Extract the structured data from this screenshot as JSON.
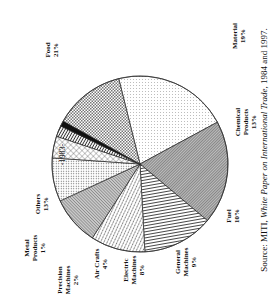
{
  "chart_data": {
    "type": "pie",
    "title": "-1983-",
    "orientation_note": "figure rotated 90 degrees counter-clockwise",
    "slices": [
      {
        "label": "Food",
        "value": 21
      },
      {
        "label": "Material",
        "value": 19
      },
      {
        "label": "Chemical Products",
        "value": 13
      },
      {
        "label": "Fuel",
        "value": 10
      },
      {
        "label": "General Machines",
        "value": 9
      },
      {
        "label": "Electric Machines",
        "value": 8
      },
      {
        "label": "Air Crafts",
        "value": 4
      },
      {
        "label": "Precision Machines",
        "value": 2
      },
      {
        "label": "Metal Products",
        "value": 1
      },
      {
        "label": "Others",
        "value": 13
      }
    ],
    "source": "Source: MITI, White Paper on International Trade, 1984 and 1997."
  },
  "labels": {
    "title": "-1983-",
    "food": [
      "Food",
      "21%"
    ],
    "material": [
      "Material",
      "19%"
    ],
    "chemical": [
      "Chemical",
      "Products",
      "13%"
    ],
    "fuel": [
      "Fuel",
      "10%"
    ],
    "general": [
      "General",
      "Machines",
      "9%"
    ],
    "electric": [
      "Electric",
      "Machines",
      "8%"
    ],
    "air": [
      "Air Crafts",
      "4%"
    ],
    "precision": [
      "Precision",
      "Machines",
      "2%"
    ],
    "metal": [
      "Metal",
      "Products",
      "1%"
    ],
    "others": [
      "Others",
      "13%"
    ]
  },
  "source": {
    "prefix": "Source: MITI, ",
    "italic": "White Paper on International Trade",
    "suffix": ", 1984 and 1997."
  }
}
